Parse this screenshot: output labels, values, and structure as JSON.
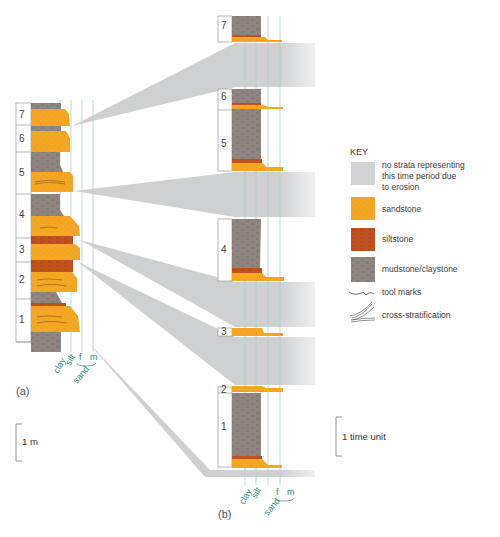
{
  "figure": {
    "panel_a_label": "(a)",
    "panel_b_label": "(b)",
    "colors": {
      "sandstone": "#f5a623",
      "siltstone": "#c0501e",
      "mudstone": "#8e8480",
      "erosion_gap": "#d2d3d5",
      "grain_lines": "#a9d3c6",
      "grain_text": "#2e8c7a"
    }
  },
  "column_a": {
    "units": [
      "7",
      "6",
      "5",
      "4",
      "3",
      "2",
      "1"
    ],
    "grain_size_labels": {
      "clay": "clay",
      "silt": "silt",
      "fine": "f",
      "medium": "m",
      "sand": "sand"
    },
    "scale_bar": "1 m"
  },
  "column_b": {
    "units": [
      "7",
      "6",
      "5",
      "4",
      "3",
      "2",
      "1"
    ],
    "grain_size_labels": {
      "clay": "clay",
      "silt": "silt",
      "fine": "f",
      "medium": "m",
      "sand": "sand"
    },
    "scale_bar": "1 time unit"
  },
  "key": {
    "title": "KEY",
    "items": [
      {
        "id": "erosion",
        "label_lines": [
          "no strata representing",
          "this time period due",
          "to erosion"
        ]
      },
      {
        "id": "sandstone",
        "label": "sandstone"
      },
      {
        "id": "siltstone",
        "label": "siltstone"
      },
      {
        "id": "mudstone",
        "label": "mudstone/claystone"
      },
      {
        "id": "tool-marks",
        "label": "tool marks"
      },
      {
        "id": "cross-stratification",
        "label": "cross-stratification"
      }
    ]
  }
}
